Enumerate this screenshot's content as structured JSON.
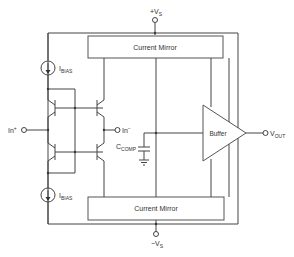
{
  "supply_positive": {
    "label": "+V",
    "sub": "S"
  },
  "supply_negative": {
    "label": "−V",
    "sub": "S"
  },
  "top_block": {
    "label": "Current Mirror"
  },
  "bottom_block": {
    "label": "Current Mirror"
  },
  "buffer": {
    "label": "Buffer"
  },
  "bias_top": {
    "label": "I",
    "sub": "BIAS"
  },
  "bias_bottom": {
    "label": "I",
    "sub": "BIAS"
  },
  "input_positive": {
    "label": "In",
    "sup": "+"
  },
  "input_negative": {
    "label": "In",
    "sup": "−"
  },
  "compensation_cap": {
    "label": "C",
    "sub": "COMP"
  },
  "output": {
    "label": "V",
    "sub": "OUT"
  }
}
